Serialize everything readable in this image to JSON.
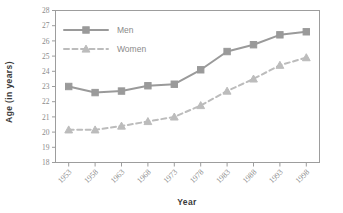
{
  "chart_data": {
    "type": "line",
    "title": "",
    "xlabel": "Year",
    "ylabel": "Age (in years)",
    "categories": [
      "1953",
      "1958",
      "1963",
      "1968",
      "1973",
      "1978",
      "1983",
      "1988",
      "1993",
      "1998"
    ],
    "x": [
      1953,
      1958,
      1963,
      1968,
      1973,
      1978,
      1983,
      1988,
      1993,
      1998
    ],
    "series": [
      {
        "name": "Men",
        "values": [
          23.0,
          22.6,
          22.7,
          23.05,
          23.15,
          24.1,
          25.3,
          25.75,
          26.4,
          26.6
        ],
        "color": "#9a9a9a",
        "line_style": "solid",
        "marker": "square"
      },
      {
        "name": "Women",
        "values": [
          20.15,
          20.15,
          20.4,
          20.7,
          21.0,
          21.75,
          22.7,
          23.5,
          24.4,
          24.9
        ],
        "color": "#bcbcbc",
        "line_style": "dashed",
        "marker": "triangle"
      }
    ],
    "ylim": [
      18,
      28
    ],
    "yticks": [
      18,
      19,
      20,
      21,
      22,
      23,
      24,
      25,
      26,
      27,
      28
    ],
    "ytick_labels": [
      "18",
      "19",
      "20",
      "21",
      "22",
      "23",
      "24",
      "25",
      "26",
      "27",
      "28"
    ],
    "grid": false,
    "legend_position": "upper-left-inside",
    "xtick_rotation": -45
  },
  "legend": {
    "entries": [
      {
        "label": "Men"
      },
      {
        "label": "Women"
      }
    ]
  },
  "axes": {
    "x_title": "Year",
    "y_title": "Age (in years)"
  },
  "colors": {
    "men": "#9a9a9a",
    "women": "#bcbcbc",
    "frame": "#9d9d9d",
    "tick_text": "#8f8f8f",
    "title_text": "#3a3a3a",
    "background": "#ffffff"
  }
}
